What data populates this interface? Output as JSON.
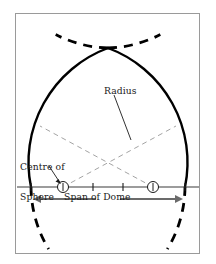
{
  "figure": {
    "background_color": "#ffffff",
    "frame": {
      "name": "figure-border",
      "x": 15,
      "y": 13,
      "width": 185,
      "height": 241,
      "stroke_color": "#9a9a9a",
      "stroke_width": 1
    }
  },
  "labels": {
    "radius": "Radius",
    "centre_of_sphere_line1": "Centre of",
    "centre_of_sphere_line2": "Sphere",
    "span_of_dome": "Span of Dome"
  },
  "colors": {
    "solid_arc": "#000000",
    "dashed_arc": "#000000",
    "construction_line": "#8c8c8c",
    "baseline": "#3a3a3a",
    "arrow": "#6b6b6b",
    "frame": "#9a9a9a",
    "text": "#1a1a1a"
  },
  "geometry": {
    "baseline": {
      "y": 187,
      "x_start": 17,
      "x_end": 199
    },
    "base_left_point": {
      "x": 31,
      "y": 187
    },
    "base_right_point": {
      "x": 185,
      "y": 187
    },
    "apex": {
      "x": 108,
      "y": 48
    },
    "centre_left": {
      "x": 63,
      "y": 187
    },
    "centre_right": {
      "x": 153,
      "y": 187
    },
    "radius": 122,
    "baseline_ticks_x": [
      31,
      63,
      93,
      123,
      153,
      185
    ],
    "arc_left_sweep_start_deg": 180,
    "arc_left_sweep_end_deg": 291,
    "dashed_arc_extension_deg": 28,
    "stroke_widths": {
      "solid_arc": 2.4,
      "dashed_arc": 2.8,
      "construction_line": 0.8,
      "baseline": 1.1,
      "leader": 0.9,
      "arrow": 2.2
    },
    "dash_patterns": {
      "arc": "9 7",
      "construction": "5 4"
    },
    "centre_markers": {
      "radius": 5.5,
      "tick_half_height": 4
    },
    "span_arrows": {
      "y": 199,
      "left_from": 96,
      "left_to": 33,
      "right_from": 120,
      "right_to": 183,
      "head_length": 7,
      "head_half_width": 4
    },
    "radius_leader": {
      "x1": 114,
      "y1": 95,
      "x2": 131,
      "y2": 140
    },
    "centre_leader": {
      "x1": 49,
      "y1": 167,
      "x2": 60,
      "y2": 182
    }
  }
}
